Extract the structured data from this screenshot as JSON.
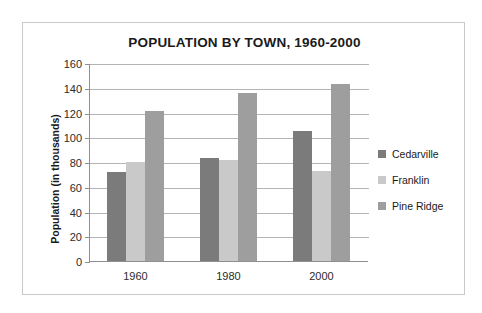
{
  "chart_data": {
    "type": "bar",
    "title": "POPULATION BY TOWN, 1960-2000",
    "xlabel": "",
    "ylabel": "Population (in thousands)",
    "categories": [
      "1960",
      "1980",
      "2000"
    ],
    "series": [
      {
        "name": "Cedarville",
        "values": [
          72,
          83,
          105
        ],
        "color": "#7b7b7b"
      },
      {
        "name": "Franklin",
        "values": [
          80,
          82,
          73
        ],
        "color": "#c9c9c9"
      },
      {
        "name": "Pine Ridge",
        "values": [
          121,
          136,
          143
        ],
        "color": "#9e9e9e"
      }
    ],
    "ylim": [
      0,
      160
    ],
    "ytick_step": 20,
    "yticks": [
      "160",
      "140",
      "120",
      "100",
      "80",
      "60",
      "40",
      "20",
      "0"
    ],
    "grid": true,
    "legend_position": "right"
  },
  "legend": {
    "items": [
      {
        "label": "Cedarville"
      },
      {
        "label": "Franklin"
      },
      {
        "label": "Pine Ridge"
      }
    ]
  },
  "colors": {
    "series_0": "#7b7b7b",
    "series_1": "#c9c9c9",
    "series_2": "#9e9e9e",
    "gridline": "#b4b4b4",
    "axis": "#8f8f8f",
    "frame": "#c9c9c9",
    "text": "#1a1a1a",
    "background": "#ffffff"
  }
}
